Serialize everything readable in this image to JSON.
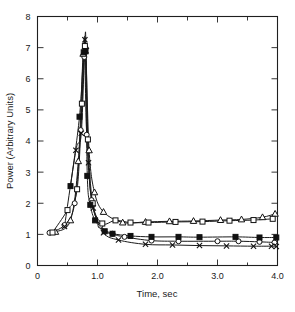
{
  "chart_data": {
    "type": "line",
    "title": "",
    "xlabel": "Time, sec",
    "ylabel": "Power (Arbitrary Units)",
    "xlim": [
      0,
      4.0
    ],
    "ylim": [
      0,
      8
    ],
    "grid": false,
    "legend": "none",
    "x_ticks_major": [
      "0",
      "1.0",
      "2.0",
      "3.0",
      "4.0"
    ],
    "x_tick_values_major": [
      0,
      1.0,
      2.0,
      3.0,
      4.0
    ],
    "x_tick_values_minor": [
      0.5,
      1.5,
      2.5,
      3.5
    ],
    "y_ticks_major": [
      "0",
      "1",
      "2",
      "3",
      "4",
      "5",
      "6",
      "7",
      "8"
    ],
    "y_tick_values_major": [
      0,
      1,
      2,
      3,
      4,
      5,
      6,
      7,
      8
    ],
    "series": [
      {
        "name": "open-circle",
        "marker": "circle-open",
        "x": [
          0.2,
          0.45,
          0.62,
          0.72,
          0.78,
          0.82,
          0.9,
          1.05,
          1.25,
          1.45,
          1.9,
          2.35,
          3.0,
          3.35,
          3.7,
          3.95
        ],
        "values": [
          1.05,
          1.3,
          2.0,
          4.35,
          6.7,
          4.2,
          2.1,
          1.28,
          1.02,
          0.92,
          0.8,
          0.78,
          0.78,
          0.78,
          0.76,
          0.74
        ]
      },
      {
        "name": "open-triangle",
        "marker": "triangle-open",
        "x": [
          0.3,
          0.55,
          0.68,
          0.76,
          0.8,
          0.86,
          0.95,
          1.1,
          1.42,
          1.8,
          2.2,
          2.6,
          3.05,
          3.4,
          3.75,
          3.96
        ],
        "values": [
          1.08,
          1.45,
          3.35,
          6.8,
          7.05,
          3.7,
          2.35,
          1.72,
          1.38,
          1.4,
          1.42,
          1.43,
          1.46,
          1.48,
          1.55,
          1.66
        ]
      },
      {
        "name": "open-square",
        "marker": "square-open",
        "x": [
          0.25,
          0.5,
          0.66,
          0.74,
          0.79,
          0.84,
          0.92,
          1.08,
          1.3,
          1.55,
          1.85,
          2.3,
          2.75,
          3.2,
          3.6,
          3.92
        ],
        "values": [
          1.06,
          1.78,
          2.45,
          5.2,
          7.05,
          4.05,
          2.0,
          1.35,
          1.45,
          1.38,
          1.38,
          1.4,
          1.41,
          1.44,
          1.46,
          1.5
        ]
      },
      {
        "name": "filled-square",
        "marker": "square-filled",
        "x": [
          0.55,
          0.7,
          0.77,
          0.8,
          0.83,
          0.88,
          0.96,
          1.12,
          1.25,
          1.55,
          1.9,
          2.35,
          2.7,
          3.3,
          3.7,
          3.98
        ],
        "values": [
          2.55,
          4.78,
          6.85,
          6.88,
          2.88,
          1.95,
          1.45,
          1.1,
          1.02,
          0.95,
          0.92,
          0.92,
          0.91,
          0.92,
          0.9,
          0.9
        ]
      },
      {
        "name": "cross-x",
        "marker": "x",
        "x": [
          0.45,
          0.64,
          0.73,
          0.79,
          0.81,
          0.85,
          0.93,
          1.1,
          1.35,
          1.8,
          2.25,
          2.7,
          3.15,
          3.6,
          3.9,
          3.98
        ],
        "values": [
          1.25,
          3.7,
          4.25,
          7.25,
          6.9,
          3.3,
          1.85,
          1.05,
          0.82,
          0.68,
          0.66,
          0.64,
          0.63,
          0.62,
          0.62,
          0.61
        ]
      }
    ]
  },
  "axes": {
    "x_title": "Time, sec",
    "y_title": "Power (Arbitrary Units)"
  }
}
